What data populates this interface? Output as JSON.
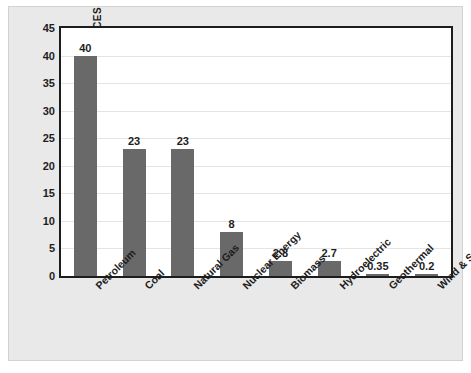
{
  "chart_data": {
    "type": "bar",
    "title": "",
    "xlabel": "",
    "ylabel": "PERCENTAGE OF TOTAL ENERGY SOURCES",
    "ylim": [
      0,
      45
    ],
    "yticks": [
      45,
      40,
      35,
      30,
      25,
      20,
      15,
      10,
      5,
      0
    ],
    "grid": true,
    "legend": "none",
    "bar_color": "#696969",
    "categories": [
      "Petroleum",
      "Coal",
      "Natural Gas",
      "Nuclear Energy",
      "Biomass",
      "Hydroelectric",
      "Geothermal",
      "Wind & Solar"
    ],
    "values": [
      40,
      23,
      23,
      8,
      2.8,
      2.7,
      0.35,
      0.2
    ],
    "value_labels": [
      "40",
      "23",
      "23",
      "8",
      "2.8",
      "2.7",
      "0.35",
      "0.2"
    ]
  }
}
